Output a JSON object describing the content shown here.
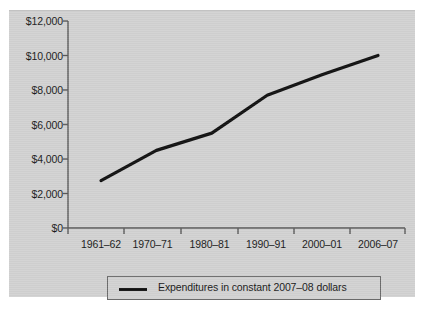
{
  "chart_data": {
    "type": "line",
    "title": "",
    "xlabel": "",
    "ylabel": "",
    "categories": [
      "1961–62",
      "1970–71",
      "1980–81",
      "1990–91",
      "2000–01",
      "2006–07"
    ],
    "series": [
      {
        "name": "Expenditures in constant 2007–08 dollars",
        "values": [
          2750,
          4500,
          5500,
          7700,
          8900,
          10000
        ],
        "color": "#111111"
      }
    ],
    "ylim": [
      0,
      12000
    ],
    "ytick_values": [
      0,
      2000,
      4000,
      6000,
      8000,
      10000,
      12000
    ],
    "ytick_labels": [
      "$0",
      "$2,000",
      "$4,000",
      "$6,000",
      "$8,000",
      "$10,000",
      "$12,000"
    ],
    "xtick_labels": [
      "1961–62",
      "1970–71",
      "1980–81",
      "1990–91",
      "2000–01",
      "2006–07"
    ],
    "grid": false,
    "legend_position": "bottom",
    "legend_entries": [
      "Expenditures in constant 2007–08 dollars"
    ],
    "background_color": "#d2d2d2",
    "axis_color": "#5a5a5a"
  },
  "legend": {
    "label": "Expenditures in constant 2007–08 dollars"
  },
  "axes": {
    "y_labels": [
      "$12,000",
      "$10,000",
      "$8,000",
      "$6,000",
      "$4,000",
      "$2,000",
      "$0"
    ],
    "x_labels": [
      "1961–62",
      "1970–71",
      "1980–81",
      "1990–91",
      "2000–01",
      "2006–07"
    ]
  }
}
